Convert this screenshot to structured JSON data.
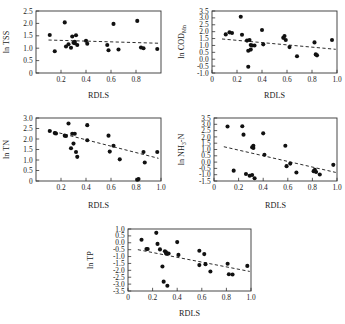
{
  "figure": {
    "panel_count": 5,
    "marker": "filled-circle",
    "marker_color": "#111111",
    "trend_style": "dashed",
    "trend_color": "#222222",
    "axis_color": "#333333"
  },
  "chart_data": [
    {
      "id": "tss",
      "type": "scatter",
      "title": "",
      "xlabel": "RDLS",
      "ylabel": "ln TSS",
      "xlim": [
        0.0,
        1.0
      ],
      "ylim": [
        0.0,
        2.5
      ],
      "xticks": [
        0.2,
        0.4,
        0.6,
        0.8
      ],
      "xticklabels": [
        "0.2",
        "0.4",
        "0.6",
        "0.8"
      ],
      "yticks": [
        0,
        0.5,
        1.0,
        1.5,
        2.0,
        2.5
      ],
      "yticklabels": [
        "0",
        "0.5",
        "1.0",
        "1.5",
        "2.0",
        "2.5"
      ],
      "grid": false,
      "legend": "none",
      "points": [
        [
          0.11,
          1.53
        ],
        [
          0.15,
          0.88
        ],
        [
          0.23,
          2.04
        ],
        [
          0.24,
          1.07
        ],
        [
          0.26,
          1.16
        ],
        [
          0.28,
          1.02
        ],
        [
          0.29,
          1.47
        ],
        [
          0.3,
          1.22
        ],
        [
          0.31,
          1.2
        ],
        [
          0.31,
          1.26
        ],
        [
          0.32,
          1.52
        ],
        [
          0.33,
          1.13
        ],
        [
          0.4,
          1.3
        ],
        [
          0.41,
          1.18
        ],
        [
          0.57,
          1.13
        ],
        [
          0.58,
          0.92
        ],
        [
          0.62,
          1.98
        ],
        [
          0.66,
          0.95
        ],
        [
          0.81,
          2.1
        ],
        [
          0.84,
          1.03
        ],
        [
          0.86,
          1.0
        ],
        [
          0.97,
          0.97
        ]
      ],
      "trendline": {
        "x": [
          0.1,
          0.98
        ],
        "y": [
          1.33,
          1.2
        ]
      }
    },
    {
      "id": "cod",
      "type": "scatter",
      "title": "",
      "xlabel": "RDLS",
      "ylabel_prefix": "ln COD",
      "ylabel_sub": "Mn",
      "ylabel": "ln CODMn",
      "xlim": [
        0.0,
        1.0
      ],
      "ylim": [
        -1.0,
        3.5
      ],
      "xticks": [
        0,
        0.2,
        0.4,
        0.6,
        0.8,
        1.0
      ],
      "xticklabels": [
        "0",
        "0.2",
        "0.4",
        "0.6",
        "0.8",
        "1.0"
      ],
      "yticks": [
        -1.0,
        -0.5,
        0.0,
        0.5,
        1.0,
        1.5,
        2.0,
        2.5,
        3.0,
        3.5
      ],
      "yticklabels": [
        "-1.0",
        "-0.5",
        "0.0",
        "0.5",
        "1.0",
        "1.5",
        "2.0",
        "2.5",
        "3.0",
        "3.5"
      ],
      "grid": false,
      "legend": "none",
      "points": [
        [
          0.11,
          1.8
        ],
        [
          0.14,
          1.95
        ],
        [
          0.16,
          1.9
        ],
        [
          0.23,
          3.08
        ],
        [
          0.24,
          1.78
        ],
        [
          0.28,
          1.35
        ],
        [
          0.29,
          0.62
        ],
        [
          0.3,
          1.4
        ],
        [
          0.31,
          1.03
        ],
        [
          0.31,
          0.7
        ],
        [
          0.32,
          1.0
        ],
        [
          0.29,
          -0.55
        ],
        [
          0.34,
          1.0
        ],
        [
          0.4,
          2.12
        ],
        [
          0.41,
          1.08
        ],
        [
          0.57,
          1.55
        ],
        [
          0.58,
          1.68
        ],
        [
          0.59,
          1.4
        ],
        [
          0.62,
          0.88
        ],
        [
          0.68,
          0.22
        ],
        [
          0.82,
          1.22
        ],
        [
          0.83,
          0.35
        ],
        [
          0.84,
          0.28
        ],
        [
          0.96,
          1.4
        ]
      ],
      "trendline": {
        "x": [
          0.08,
          0.99
        ],
        "y": [
          1.47,
          0.72
        ]
      }
    },
    {
      "id": "tn",
      "type": "scatter",
      "title": "",
      "xlabel": "RDLS",
      "ylabel": "ln TN",
      "xlim": [
        0.0,
        1.0
      ],
      "ylim": [
        0.0,
        3.0
      ],
      "xticks": [
        0.2,
        0.4,
        0.6,
        0.8,
        1.0
      ],
      "xticklabels": [
        "0.2",
        "0.4",
        "0.6",
        "0.8",
        "1.0"
      ],
      "yticks": [
        0,
        0.5,
        1.0,
        1.5,
        2.0,
        2.5,
        3.0
      ],
      "yticklabels": [
        "0",
        "0.5",
        "1.0",
        "1.5",
        "2.0",
        "2.5",
        "3.0"
      ],
      "grid": false,
      "legend": "none",
      "points": [
        [
          0.11,
          2.38
        ],
        [
          0.15,
          2.28
        ],
        [
          0.16,
          2.26
        ],
        [
          0.23,
          2.16
        ],
        [
          0.24,
          2.14
        ],
        [
          0.26,
          2.74
        ],
        [
          0.28,
          1.56
        ],
        [
          0.29,
          2.25
        ],
        [
          0.3,
          1.78
        ],
        [
          0.31,
          2.25
        ],
        [
          0.32,
          1.38
        ],
        [
          0.33,
          1.15
        ],
        [
          0.41,
          2.66
        ],
        [
          0.41,
          1.94
        ],
        [
          0.58,
          2.16
        ],
        [
          0.59,
          1.4
        ],
        [
          0.62,
          1.68
        ],
        [
          0.67,
          1.03
        ],
        [
          0.81,
          0.06
        ],
        [
          0.82,
          0.09
        ],
        [
          0.86,
          1.38
        ],
        [
          0.87,
          0.88
        ],
        [
          0.97,
          1.38
        ]
      ],
      "trendline": {
        "x": [
          0.1,
          0.98
        ],
        "y": [
          2.42,
          1.08
        ]
      }
    },
    {
      "id": "nh3n",
      "type": "scatter",
      "title": "",
      "xlabel": "RDLS",
      "ylabel_prefix": "ln NH",
      "ylabel_sub": "3",
      "ylabel_suffix": "-N",
      "ylabel": "ln NH3-N",
      "xlim": [
        0.0,
        1.0
      ],
      "ylim": [
        -1.5,
        3.5
      ],
      "xticks": [
        0,
        0.2,
        0.4,
        0.6,
        0.8,
        1.0
      ],
      "xticklabels": [
        "0",
        "0.2",
        "0.4",
        "0.6",
        "0.8",
        "1.0"
      ],
      "yticks": [
        -1.5,
        -1.0,
        -0.5,
        0.0,
        0.5,
        1.0,
        1.5,
        2.0,
        2.5,
        3.0,
        3.5
      ],
      "yticklabels": [
        "-1.5",
        "-1.0",
        "-0.5",
        "0.0",
        "0.5",
        "1.0",
        "1.5",
        "2.0",
        "2.5",
        "3.0",
        "3.5"
      ],
      "grid": false,
      "legend": "none",
      "points": [
        [
          0.11,
          2.82
        ],
        [
          0.16,
          -0.68
        ],
        [
          0.23,
          2.84
        ],
        [
          0.24,
          2.18
        ],
        [
          0.26,
          -0.95
        ],
        [
          0.29,
          -1.08
        ],
        [
          0.31,
          -1.02
        ],
        [
          0.31,
          1.18
        ],
        [
          0.32,
          1.3
        ],
        [
          0.32,
          1.12
        ],
        [
          0.33,
          -1.28
        ],
        [
          0.4,
          2.28
        ],
        [
          0.41,
          0.58
        ],
        [
          0.58,
          1.3
        ],
        [
          0.59,
          -0.32
        ],
        [
          0.62,
          -0.12
        ],
        [
          0.67,
          -0.82
        ],
        [
          0.81,
          -0.72
        ],
        [
          0.82,
          -0.62
        ],
        [
          0.83,
          -0.78
        ],
        [
          0.86,
          -0.98
        ],
        [
          0.97,
          -0.22
        ]
      ],
      "trendline": {
        "x": [
          0.08,
          0.99
        ],
        "y": [
          1.22,
          -0.82
        ]
      }
    },
    {
      "id": "tp",
      "type": "scatter",
      "title": "",
      "xlabel": "RDLS",
      "ylabel": "ln TP",
      "xlim": [
        0.0,
        1.0
      ],
      "ylim": [
        -3.5,
        1.0
      ],
      "xticks": [
        0,
        0.2,
        0.4,
        0.6,
        0.8,
        1.0
      ],
      "xticklabels": [
        "0",
        "0.2",
        "0.4",
        "0.6",
        "0.8",
        "1.0"
      ],
      "yticks": [
        -3.5,
        -3.0,
        -2.5,
        -2.0,
        -1.5,
        -1.0,
        -0.5,
        0.0,
        0.5,
        1.0
      ],
      "yticklabels": [
        "-3.5",
        "-3.0",
        "-2.5",
        "-2.0",
        "-1.5",
        "-1.0",
        "-0.5",
        "0.0",
        "0.5",
        "1.0"
      ],
      "grid": false,
      "legend": "none",
      "points": [
        [
          0.11,
          0.22
        ],
        [
          0.15,
          -0.45
        ],
        [
          0.16,
          -0.45
        ],
        [
          0.23,
          0.72
        ],
        [
          0.24,
          -0.08
        ],
        [
          0.26,
          -0.48
        ],
        [
          0.28,
          -1.72
        ],
        [
          0.3,
          -0.62
        ],
        [
          0.31,
          -0.7
        ],
        [
          0.31,
          -0.78
        ],
        [
          0.29,
          -2.82
        ],
        [
          0.32,
          -3.12
        ],
        [
          0.33,
          -0.78
        ],
        [
          0.4,
          0.05
        ],
        [
          0.41,
          -0.88
        ],
        [
          0.58,
          -0.58
        ],
        [
          0.58,
          -1.62
        ],
        [
          0.62,
          -0.82
        ],
        [
          0.63,
          -1.55
        ],
        [
          0.67,
          -2.08
        ],
        [
          0.81,
          -1.52
        ],
        [
          0.82,
          -2.28
        ],
        [
          0.85,
          -2.3
        ],
        [
          0.97,
          -1.68
        ]
      ],
      "trendline": {
        "x": [
          0.08,
          0.99
        ],
        "y": [
          -0.5,
          -2.08
        ]
      }
    }
  ]
}
